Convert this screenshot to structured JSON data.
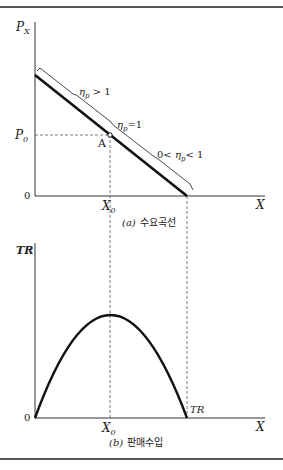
{
  "panel_a": {
    "y_axis_label": "P",
    "y_axis_sub": "X",
    "x_axis_label": "X",
    "origin_label": "0",
    "price_label": "P",
    "price_sub": "0",
    "quantity_label": "X",
    "quantity_sub": "0",
    "point_label": "A",
    "elastic_label": "η",
    "elastic_sub": "p",
    "elastic_rel": " > 1",
    "unit_label": "η",
    "unit_sub": "p",
    "unit_rel": "=1",
    "inelastic_pre": "0< ",
    "inelastic_label": "η",
    "inelastic_sub": "p",
    "inelastic_rel": "< 1",
    "caption_letter": "(a)",
    "caption_text": "수요곡선"
  },
  "panel_b": {
    "y_axis_label": "TR",
    "x_axis_label": "X",
    "origin_label": "0",
    "quantity_label": "X",
    "quantity_sub": "0",
    "curve_label": "TR",
    "caption_letter": "(b)",
    "caption_text": "판매수입"
  },
  "colors": {
    "line": "#111111",
    "axis": "#333333",
    "dashed": "#555555"
  }
}
